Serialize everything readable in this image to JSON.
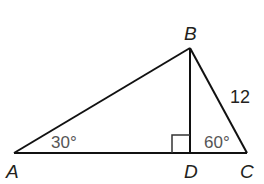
{
  "diagram": {
    "type": "triangle",
    "vertices": {
      "A": {
        "label": "A",
        "x": 14,
        "y": 153
      },
      "B": {
        "label": "B",
        "x": 190,
        "y": 48
      },
      "C": {
        "label": "C",
        "x": 247,
        "y": 153
      },
      "D": {
        "label": "D",
        "x": 190,
        "y": 153
      }
    },
    "segments": [
      "AB",
      "BC",
      "AC",
      "BD"
    ],
    "angle_labels": {
      "A": "30°",
      "C": "60°"
    },
    "right_angle_at": "D",
    "side_labels": {
      "BC": "12"
    }
  }
}
